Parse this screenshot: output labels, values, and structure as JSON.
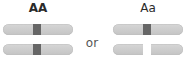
{
  "genotypes": [
    {
      "label": "AA",
      "chromosomes": [
        {
          "allele": "A",
          "band_color": "#666666"
        },
        {
          "allele": "A",
          "band_color": "#666666"
        }
      ]
    },
    {
      "label": "Aa",
      "chromosomes": [
        {
          "allele": "A",
          "band_color": "#666666"
        },
        {
          "allele": "a",
          "band_color": "#ffffff"
        }
      ]
    }
  ],
  "connector": "or",
  "colors": {
    "chromosome_body": "#cccccc",
    "dominant_band": "#666666",
    "recessive_band": "#ffffff",
    "text": "#2a2a2a"
  }
}
